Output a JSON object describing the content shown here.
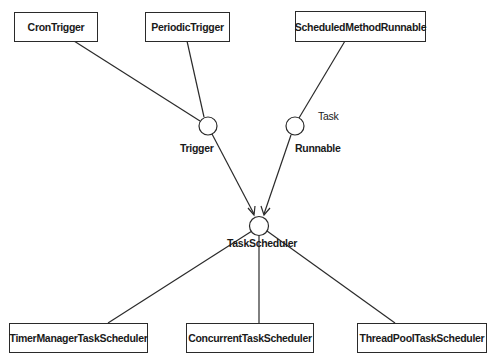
{
  "diagram": {
    "classes_top": [
      {
        "id": "cron",
        "label": "CronTrigger"
      },
      {
        "id": "periodic",
        "label": "PeriodicTrigger"
      },
      {
        "id": "scheduled",
        "label": "ScheduledMethodRunnable"
      }
    ],
    "interfaces": [
      {
        "id": "trigger",
        "label": "Trigger"
      },
      {
        "id": "runnable",
        "label": "Runnable"
      },
      {
        "id": "taskscheduler",
        "label": "TaskScheduler"
      }
    ],
    "annotations": {
      "task": "Task"
    },
    "classes_bottom": [
      {
        "id": "timermanager",
        "label": "TimerManagerTaskScheduler"
      },
      {
        "id": "concurrent",
        "label": "ConcurrentTaskScheduler"
      },
      {
        "id": "threadpool",
        "label": "ThreadPoolTaskScheduler"
      }
    ],
    "edges": [
      {
        "from": "CronTrigger",
        "to": "Trigger",
        "type": "realization"
      },
      {
        "from": "PeriodicTrigger",
        "to": "Trigger",
        "type": "realization"
      },
      {
        "from": "ScheduledMethodRunnable",
        "to": "Runnable",
        "type": "realization"
      },
      {
        "from": "Trigger",
        "to": "TaskScheduler",
        "type": "dependency-arrow"
      },
      {
        "from": "Runnable",
        "to": "TaskScheduler",
        "type": "dependency-arrow"
      },
      {
        "from": "TimerManagerTaskScheduler",
        "to": "TaskScheduler",
        "type": "realization"
      },
      {
        "from": "ConcurrentTaskScheduler",
        "to": "TaskScheduler",
        "type": "realization"
      },
      {
        "from": "ThreadPoolTaskScheduler",
        "to": "TaskScheduler",
        "type": "realization"
      }
    ]
  }
}
